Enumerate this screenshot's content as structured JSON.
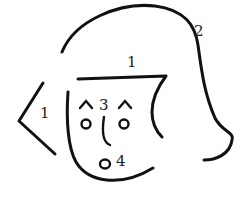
{
  "figure": {
    "labels": {
      "hair": "2",
      "bangs": "1",
      "ear": "1",
      "eyes_nose": "3",
      "mouth": "4"
    },
    "colors": {
      "ink": "#111111",
      "background": "#ffffff"
    }
  }
}
